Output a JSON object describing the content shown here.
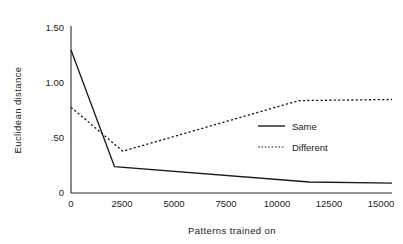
{
  "chart_data": {
    "type": "line",
    "title": "",
    "xlabel": "Patterns trained on",
    "ylabel": "Euclidean distance",
    "xlim": [
      0,
      15500
    ],
    "ylim": [
      0,
      1.5
    ],
    "grid": false,
    "legend_position": "center-right",
    "xticks": [
      0,
      2500,
      5000,
      7500,
      10000,
      12500,
      15000
    ],
    "xtick_labels": [
      "0",
      "2500",
      "5000",
      "7500",
      "10000",
      "12500",
      "15000"
    ],
    "yticks": [
      0,
      0.5,
      1.0,
      1.5
    ],
    "ytick_labels": [
      "0",
      ".50",
      "1.00",
      "1.50"
    ],
    "series": [
      {
        "name": "Same",
        "style": "solid",
        "color": "#1a1a1a",
        "x": [
          0,
          2100,
          11500,
          15500
        ],
        "values": [
          1.3,
          0.24,
          0.1,
          0.09
        ]
      },
      {
        "name": "Different",
        "style": "dotted",
        "color": "#1a1a1a",
        "x": [
          0,
          2500,
          11000,
          15500
        ],
        "values": [
          0.78,
          0.38,
          0.84,
          0.85
        ]
      }
    ]
  },
  "legend": {
    "items": [
      {
        "label": "Same",
        "style": "solid"
      },
      {
        "label": "Different",
        "style": "dotted"
      }
    ]
  },
  "axes": {
    "x_title": "Patterns trained on",
    "y_title": "Euclidean distance"
  }
}
